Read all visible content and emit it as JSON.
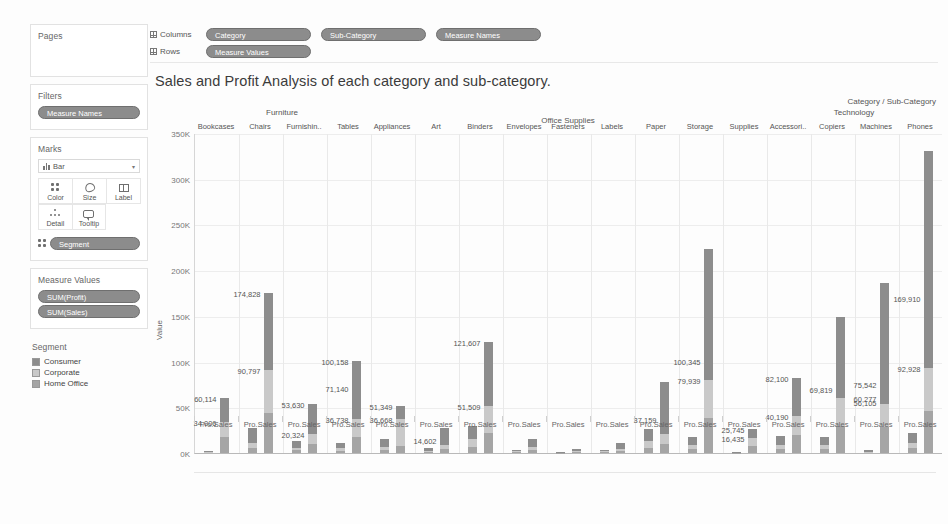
{
  "sidebar": {
    "pages": {
      "title": "Pages"
    },
    "filters": {
      "title": "Filters",
      "items": [
        "Measure Names"
      ]
    },
    "marks": {
      "title": "Marks",
      "mark_type": "Bar",
      "buttons": [
        {
          "label": "Color",
          "icon": "color-icon"
        },
        {
          "label": "Size",
          "icon": "size-icon"
        },
        {
          "label": "Label",
          "icon": "label-icon"
        },
        {
          "label": "Detail",
          "icon": "detail-icon"
        },
        {
          "label": "Tooltip",
          "icon": "tooltip-icon"
        }
      ],
      "encoding_pill": "Segment"
    },
    "measure_values": {
      "title": "Measure Values",
      "items": [
        "SUM(Profit)",
        "SUM(Sales)"
      ]
    },
    "legend": {
      "title": "Segment",
      "items": [
        {
          "label": "Consumer",
          "color": "#8d8d8d"
        },
        {
          "label": "Corporate",
          "color": "#c9c9c9"
        },
        {
          "label": "Home Office",
          "color": "#a5a5a5"
        }
      ]
    }
  },
  "shelves": {
    "columns_label": "Columns",
    "columns": [
      "Category",
      "Sub-Category",
      "Measure Names"
    ],
    "rows_label": "Rows",
    "rows": [
      "Measure Values"
    ]
  },
  "title": "Sales and Profit Analysis of each category and sub-category.",
  "chart_data": {
    "type": "bar",
    "title": "Sales and Profit Analysis of each category and sub-category.",
    "subtype": "stacked-grouped",
    "xlabel": "Category / Sub-Category",
    "ylabel": "Value",
    "ylim": [
      0,
      350000
    ],
    "yticks": [
      "0K",
      "50K",
      "100K",
      "150K",
      "200K",
      "250K",
      "300K",
      "350K"
    ],
    "ytick_values": [
      0,
      50000,
      100000,
      150000,
      200000,
      250000,
      300000,
      350000
    ],
    "grid": true,
    "legend_position": "left-sidebar",
    "stack_series": [
      "Home Office",
      "Corporate",
      "Consumer"
    ],
    "measures": [
      "Profit",
      "Sales"
    ],
    "measure_tick_labels": [
      "Pro..",
      "Sales"
    ],
    "category_header": "Category / Sub-Category",
    "categories": [
      {
        "name": "Furniture",
        "subs": [
          "Bookcases",
          "Chairs",
          "Furnishin..",
          "Tables"
        ]
      },
      {
        "name": "Office Supplies",
        "subs": [
          "Appliances",
          "Art",
          "Binders",
          "Envelopes",
          "Fasteners",
          "Labels",
          "Paper",
          "Storage",
          "Supplies"
        ]
      },
      {
        "name": "Technology",
        "subs": [
          "Accessori..",
          "Copiers",
          "Machines",
          "Phones"
        ]
      }
    ],
    "bars": [
      {
        "sub": "Bookcases",
        "measure": "Profit",
        "home_office": 600,
        "corporate": 700,
        "consumer": 900,
        "total": 2200,
        "labels": []
      },
      {
        "sub": "Bookcases",
        "measure": "Sales",
        "home_office": 17000,
        "corporate": 17006,
        "consumer": 26108,
        "total": 60114,
        "labels": [
          {
            "text": "34,006",
            "value": 34006
          },
          {
            "text": "60,114",
            "value": 60114
          }
        ]
      },
      {
        "sub": "Chairs",
        "measure": "Profit",
        "home_office": 6000,
        "corporate": 5000,
        "consumer": 16000,
        "total": 27000,
        "labels": []
      },
      {
        "sub": "Chairs",
        "measure": "Sales",
        "home_office": 44000,
        "corporate": 46797,
        "consumer": 84031,
        "total": 174828,
        "labels": [
          {
            "text": "90,797",
            "value": 90797
          },
          {
            "text": "174,828",
            "value": 174828
          }
        ]
      },
      {
        "sub": "Furnishin..",
        "measure": "Profit",
        "home_office": 3000,
        "corporate": 3000,
        "consumer": 7000,
        "total": 13000,
        "labels": []
      },
      {
        "sub": "Furnishin..",
        "measure": "Sales",
        "home_office": 10000,
        "corporate": 10324,
        "consumer": 33306,
        "total": 53630,
        "labels": [
          {
            "text": "20,324",
            "value": 20324
          },
          {
            "text": "53,630",
            "value": 53630
          }
        ]
      },
      {
        "sub": "Tables",
        "measure": "Profit",
        "home_office": 2500,
        "corporate": 3000,
        "consumer": 5500,
        "total": 11000,
        "labels": []
      },
      {
        "sub": "Tables",
        "measure": "Sales",
        "home_office": 17000,
        "corporate": 19738,
        "consumer": 63420,
        "total": 100158,
        "labels": [
          {
            "text": "36,738",
            "value": 36738
          },
          {
            "text": "71,140",
            "value": 71140
          },
          {
            "text": "100,158",
            "value": 100158
          }
        ]
      },
      {
        "sub": "Appliances",
        "measure": "Profit",
        "home_office": 3500,
        "corporate": 3500,
        "consumer": 8000,
        "total": 15000,
        "labels": []
      },
      {
        "sub": "Appliances",
        "measure": "Sales",
        "home_office": 8000,
        "corporate": 28668,
        "consumer": 14681,
        "total": 51349,
        "labels": [
          {
            "text": "36,668",
            "value": 36668
          },
          {
            "text": "51,349",
            "value": 51349
          }
        ]
      },
      {
        "sub": "Art",
        "measure": "Profit",
        "home_office": 1200,
        "corporate": 1300,
        "consumer": 2500,
        "total": 5000,
        "labels": []
      },
      {
        "sub": "Art",
        "measure": "Sales",
        "home_office": 4000,
        "corporate": 5000,
        "consumer": 18000,
        "total": 27000,
        "labels": [
          {
            "text": "14,602",
            "value": 14602
          }
        ]
      },
      {
        "sub": "Binders",
        "measure": "Profit",
        "home_office": 7000,
        "corporate": 8000,
        "consumer": 15000,
        "total": 30000,
        "labels": []
      },
      {
        "sub": "Binders",
        "measure": "Sales",
        "home_office": 22000,
        "corporate": 29509,
        "consumer": 70098,
        "total": 203607,
        "labels": [
          {
            "text": "51,509",
            "value": 51509
          },
          {
            "text": "121,607",
            "value": 121607
          }
        ]
      },
      {
        "sub": "Envelopes",
        "measure": "Profit",
        "home_office": 900,
        "corporate": 1000,
        "consumer": 1800,
        "total": 3700,
        "labels": []
      },
      {
        "sub": "Envelopes",
        "measure": "Sales",
        "home_office": 3000,
        "corporate": 3500,
        "consumer": 9000,
        "total": 15500,
        "labels": []
      },
      {
        "sub": "Fasteners",
        "measure": "Profit",
        "home_office": 300,
        "corporate": 300,
        "consumer": 600,
        "total": 1200,
        "labels": []
      },
      {
        "sub": "Fasteners",
        "measure": "Sales",
        "home_office": 800,
        "corporate": 900,
        "consumer": 2300,
        "total": 4000,
        "labels": []
      },
      {
        "sub": "Labels",
        "measure": "Profit",
        "home_office": 800,
        "corporate": 900,
        "consumer": 1800,
        "total": 3500,
        "labels": []
      },
      {
        "sub": "Labels",
        "measure": "Sales",
        "home_office": 2000,
        "corporate": 2200,
        "consumer": 7000,
        "total": 11200,
        "labels": []
      },
      {
        "sub": "Paper",
        "measure": "Profit",
        "home_office": 6000,
        "corporate": 7000,
        "consumer": 13000,
        "total": 26000,
        "labels": []
      },
      {
        "sub": "Paper",
        "measure": "Sales",
        "home_office": 10000,
        "corporate": 11159,
        "consumer": 57000,
        "total": 78000,
        "labels": [
          {
            "text": "37,159",
            "value": 37159
          }
        ]
      },
      {
        "sub": "Storage",
        "measure": "Profit",
        "home_office": 4000,
        "corporate": 4500,
        "consumer": 9000,
        "total": 17500,
        "labels": []
      },
      {
        "sub": "Storage",
        "measure": "Sales",
        "home_office": 38000,
        "corporate": 41939,
        "consumer": 143406,
        "total": 223345,
        "labels": [
          {
            "text": "79,939",
            "value": 79939
          },
          {
            "text": "100,345",
            "value": 100345
          }
        ]
      },
      {
        "sub": "Supplies",
        "measure": "Profit",
        "home_office": 300,
        "corporate": 300,
        "consumer": 500,
        "total": 1100,
        "labels": []
      },
      {
        "sub": "Supplies",
        "measure": "Sales",
        "home_office": 8000,
        "corporate": 8435,
        "consumer": 9310,
        "total": 41000,
        "labels": [
          {
            "text": "16,435",
            "value": 16435
          },
          {
            "text": "25,745",
            "value": 25745
          }
        ]
      },
      {
        "sub": "Accessori..",
        "measure": "Profit",
        "home_office": 4000,
        "corporate": 4500,
        "consumer": 10000,
        "total": 18500,
        "labels": []
      },
      {
        "sub": "Accessori..",
        "measure": "Sales",
        "home_office": 20000,
        "corporate": 20190,
        "consumer": 41910,
        "total": 167000,
        "labels": [
          {
            "text": "40,190",
            "value": 40190
          },
          {
            "text": "82,100",
            "value": 82100
          }
        ]
      },
      {
        "sub": "Copiers",
        "measure": "Profit",
        "home_office": 4500,
        "corporate": 4500,
        "consumer": 9000,
        "total": 18000,
        "labels": []
      },
      {
        "sub": "Copiers",
        "measure": "Sales",
        "home_office": 30000,
        "corporate": 30000,
        "consumer": 89000,
        "total": 149000,
        "labels": [
          {
            "text": "69,819",
            "value": 69819
          }
        ]
      },
      {
        "sub": "Machines",
        "measure": "Profit",
        "home_office": 700,
        "corporate": 800,
        "consumer": 1400,
        "total": 2900,
        "labels": []
      },
      {
        "sub": "Machines",
        "measure": "Sales",
        "home_office": 28000,
        "corporate": 26105,
        "consumer": 131437,
        "total": 185542,
        "labels": [
          {
            "text": "56,105",
            "value": 56105
          },
          {
            "text": "60,277",
            "value": 60277
          },
          {
            "text": "75,542",
            "value": 75542
          }
        ]
      },
      {
        "sub": "Phones",
        "measure": "Profit",
        "home_office": 5000,
        "corporate": 5500,
        "consumer": 11000,
        "total": 21500,
        "labels": []
      },
      {
        "sub": "Phones",
        "measure": "Sales",
        "home_office": 46000,
        "corporate": 46928,
        "consumer": 237000,
        "total": 330000,
        "labels": [
          {
            "text": "92,928",
            "value": 92928
          },
          {
            "text": "169,910",
            "value": 169910
          }
        ]
      }
    ]
  }
}
